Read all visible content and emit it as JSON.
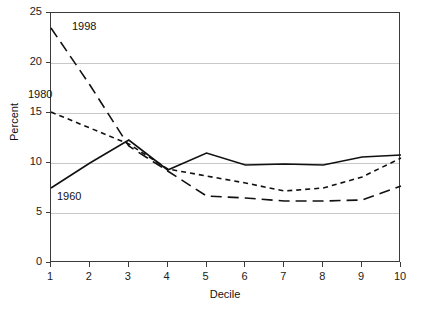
{
  "title_remnant": "",
  "chart_data": {
    "type": "line",
    "title": "",
    "xlabel": "Decile",
    "ylabel": "Percent",
    "categories": [
      "1",
      "2",
      "3",
      "4",
      "5",
      "6",
      "7",
      "8",
      "9",
      "10"
    ],
    "x": [
      1,
      2,
      3,
      4,
      5,
      6,
      7,
      8,
      9,
      10
    ],
    "xlim": [
      1,
      10
    ],
    "ylim": [
      0,
      25
    ],
    "yticks": [
      0,
      5,
      10,
      15,
      20,
      25
    ],
    "grid": "horizontal",
    "legend_position": "inline-annotations",
    "series": [
      {
        "name": "1960",
        "style": "solid",
        "values": [
          7.5,
          10.0,
          12.3,
          9.3,
          11.0,
          9.8,
          9.9,
          9.8,
          10.6,
          10.8
        ]
      },
      {
        "name": "1980",
        "style": "short-dash",
        "values": [
          15.1,
          13.5,
          11.9,
          9.4,
          8.7,
          8.0,
          7.2,
          7.5,
          8.6,
          10.5
        ]
      },
      {
        "name": "1998",
        "style": "long-dash",
        "values": [
          23.5,
          17.8,
          11.7,
          9.2,
          6.7,
          6.5,
          6.2,
          6.2,
          6.3,
          7.7
        ]
      }
    ],
    "annotations": [
      {
        "text": "1998",
        "x_px": 72,
        "y_px": 20
      },
      {
        "text": "1980",
        "x_px": 28,
        "y_px": 88
      },
      {
        "text": "1960",
        "x_px": 57,
        "y_px": 190
      }
    ]
  }
}
